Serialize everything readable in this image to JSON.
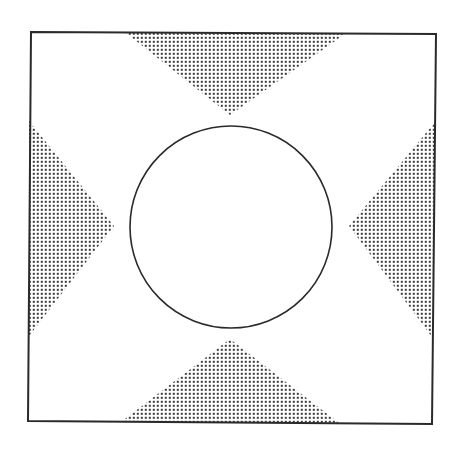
{
  "diagram": {
    "colors": {
      "background": "#ffffff",
      "line": "#2a2a2a",
      "dot": "#3a3a3a"
    },
    "frame": {
      "top_left": [
        31,
        32
      ],
      "top_right": [
        436,
        34
      ],
      "bottom_right": [
        432,
        424
      ],
      "bottom_left": [
        28,
        421
      ]
    },
    "circle": {
      "cx": 231,
      "cy": 227,
      "r": 101
    },
    "dot_spacing": 4,
    "shaded_regions": [
      {
        "name": "top-wedge",
        "base_start": [
          126,
          33
        ],
        "apex": [
          230,
          115
        ],
        "base_end": [
          345,
          34
        ]
      },
      {
        "name": "bottom-wedge",
        "base_start": [
          121,
          422
        ],
        "apex": [
          230,
          339
        ],
        "base_end": [
          339,
          423
        ]
      },
      {
        "name": "left-wedge",
        "base_start": [
          29,
          121
        ],
        "apex": [
          114,
          226
        ],
        "base_end": [
          29,
          336
        ]
      },
      {
        "name": "right-wedge",
        "base_start": [
          435,
          122
        ],
        "apex": [
          349,
          226
        ],
        "base_end": [
          432,
          337
        ]
      }
    ]
  }
}
